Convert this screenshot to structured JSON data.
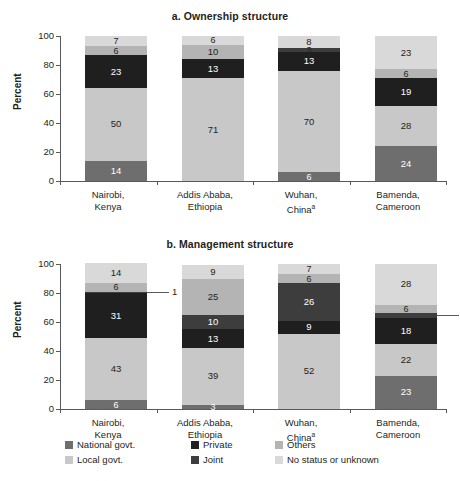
{
  "figure": {
    "ylabel": "Percent",
    "yticks": [
      "0",
      "20",
      "40",
      "60",
      "80",
      "100"
    ],
    "categories": [
      "Nairobi,\nKenya",
      "Addis Ababa,\nEthiopia",
      "Wuhan,\nChina",
      "Bamenda,\nCameroon"
    ],
    "category_lines": [
      {
        "l1": "Nairobi,",
        "l2": "Kenya",
        "sup": ""
      },
      {
        "l1": "Addis Ababa,",
        "l2": "Ethiopia",
        "sup": ""
      },
      {
        "l1": "Wuhan,",
        "l2": "China",
        "sup": "a"
      },
      {
        "l1": "Bamenda,",
        "l2": "Cameroon",
        "sup": ""
      }
    ]
  },
  "legend": {
    "position": "bottom",
    "items": [
      {
        "label": "National govt.",
        "color": "#6e6e6e"
      },
      {
        "label": "Private",
        "color": "#1f1f1f"
      },
      {
        "label": "Others",
        "color": "#b4b4b4"
      },
      {
        "label": "Local govt.",
        "color": "#c8c8c8"
      },
      {
        "label": "Joint",
        "color": "#3d3d3d"
      },
      {
        "label": "No status or unknown",
        "color": "#d9d9d9"
      }
    ]
  },
  "chart_data": [
    {
      "type": "bar",
      "subtype": "stacked-vertical-100",
      "title": "a. Ownership structure",
      "xlabel": "",
      "ylabel": "Percent",
      "ylim": [
        0,
        100
      ],
      "yticks": [
        0,
        20,
        40,
        60,
        80,
        100
      ],
      "grid": false,
      "legend": "bottom",
      "categories": [
        "Nairobi, Kenya",
        "Addis Ababa, Ethiopia",
        "Wuhan, China",
        "Bamenda, Cameroon"
      ],
      "series": [
        {
          "name": "National govt.",
          "color": "#6e6e6e",
          "values": [
            14,
            0,
            6,
            24
          ]
        },
        {
          "name": "Local govt.",
          "color": "#c8c8c8",
          "values": [
            50,
            71,
            70,
            28
          ]
        },
        {
          "name": "Private",
          "color": "#1f1f1f",
          "values": [
            23,
            13,
            13,
            19
          ]
        },
        {
          "name": "Joint",
          "color": "#3d3d3d",
          "values": [
            0,
            0,
            3,
            0
          ]
        },
        {
          "name": "Others",
          "color": "#b4b4b4",
          "values": [
            6,
            10,
            0,
            6
          ]
        },
        {
          "name": "No status or unknown",
          "color": "#d9d9d9",
          "values": [
            7,
            6,
            8,
            23
          ]
        }
      ],
      "bars": [
        {
          "category": "Nairobi, Kenya",
          "segments": [
            {
              "series": "National govt.",
              "value": 14,
              "label": "14",
              "color": "#6e6e6e",
              "text": "light-on-dark"
            },
            {
              "series": "Local govt.",
              "value": 50,
              "label": "50",
              "color": "#c8c8c8",
              "text": "dark-on-light"
            },
            {
              "series": "Private",
              "value": 23,
              "label": "23",
              "color": "#1f1f1f",
              "text": "light-on-dark"
            },
            {
              "series": "Others",
              "value": 6,
              "label": "6",
              "color": "#b4b4b4",
              "text": "dark-on-light"
            },
            {
              "series": "No status or unknown",
              "value": 7,
              "label": "7",
              "color": "#d9d9d9",
              "text": "dark-on-light"
            }
          ]
        },
        {
          "category": "Addis Ababa, Ethiopia",
          "segments": [
            {
              "series": "Local govt.",
              "value": 71,
              "label": "71",
              "color": "#c8c8c8",
              "text": "dark-on-light"
            },
            {
              "series": "Private",
              "value": 13,
              "label": "13",
              "color": "#1f1f1f",
              "text": "light-on-dark"
            },
            {
              "series": "Others",
              "value": 10,
              "label": "10",
              "color": "#b4b4b4",
              "text": "dark-on-light"
            },
            {
              "series": "No status or unknown",
              "value": 6,
              "label": "6",
              "color": "#d9d9d9",
              "text": "dark-on-light"
            }
          ]
        },
        {
          "category": "Wuhan, China",
          "segments": [
            {
              "series": "National govt.",
              "value": 6,
              "label": "6",
              "color": "#6e6e6e",
              "text": "light-on-dark"
            },
            {
              "series": "Local govt.",
              "value": 70,
              "label": "70",
              "color": "#c8c8c8",
              "text": "dark-on-light"
            },
            {
              "series": "Private",
              "value": 13,
              "label": "13",
              "color": "#1f1f1f",
              "text": "light-on-dark"
            },
            {
              "series": "Joint",
              "value": 3,
              "label": "3",
              "color": "#3d3d3d",
              "text": "dark-on-light"
            },
            {
              "series": "No status or unknown",
              "value": 8,
              "label": "8",
              "color": "#d9d9d9",
              "text": "dark-on-light"
            }
          ]
        },
        {
          "category": "Bamenda, Cameroon",
          "segments": [
            {
              "series": "National govt.",
              "value": 24,
              "label": "24",
              "color": "#6e6e6e",
              "text": "light-on-dark"
            },
            {
              "series": "Local govt.",
              "value": 28,
              "label": "28",
              "color": "#c8c8c8",
              "text": "dark-on-light"
            },
            {
              "series": "Private",
              "value": 19,
              "label": "19",
              "color": "#1f1f1f",
              "text": "light-on-dark"
            },
            {
              "series": "Others",
              "value": 6,
              "label": "6",
              "color": "#b4b4b4",
              "text": "dark-on-light"
            },
            {
              "series": "No status or unknown",
              "value": 23,
              "label": "23",
              "color": "#d9d9d9",
              "text": "dark-on-light"
            }
          ]
        }
      ]
    },
    {
      "type": "bar",
      "subtype": "stacked-vertical-100",
      "title": "b. Management structure",
      "xlabel": "",
      "ylabel": "Percent",
      "ylim": [
        0,
        100
      ],
      "yticks": [
        0,
        20,
        40,
        60,
        80,
        100
      ],
      "grid": false,
      "legend": "bottom",
      "categories": [
        "Nairobi, Kenya",
        "Addis Ababa, Ethiopia",
        "Wuhan, China",
        "Bamenda, Cameroon"
      ],
      "annotations": [
        {
          "category": "Nairobi, Kenya",
          "series": "Joint",
          "value": 1,
          "label": "1",
          "style": "leader-line-right"
        },
        {
          "category": "Bamenda, Cameroon",
          "series": "Joint",
          "value": 3,
          "label": "3",
          "style": "leader-line-right"
        }
      ],
      "series": [
        {
          "name": "National govt.",
          "color": "#6e6e6e",
          "values": [
            6,
            3,
            0,
            23
          ]
        },
        {
          "name": "Local govt.",
          "color": "#c8c8c8",
          "values": [
            43,
            39,
            52,
            22
          ]
        },
        {
          "name": "Private",
          "color": "#1f1f1f",
          "values": [
            31,
            13,
            9,
            18
          ]
        },
        {
          "name": "Joint",
          "color": "#3d3d3d",
          "values": [
            1,
            10,
            26,
            3
          ]
        },
        {
          "name": "Others",
          "color": "#b4b4b4",
          "values": [
            6,
            25,
            6,
            6
          ]
        },
        {
          "name": "No status or unknown",
          "color": "#d9d9d9",
          "values": [
            14,
            9,
            7,
            28
          ]
        }
      ],
      "bars": [
        {
          "category": "Nairobi, Kenya",
          "segments": [
            {
              "series": "National govt.",
              "value": 6,
              "label": "6",
              "color": "#6e6e6e",
              "text": "light-on-dark"
            },
            {
              "series": "Local govt.",
              "value": 43,
              "label": "43",
              "color": "#c8c8c8",
              "text": "dark-on-light"
            },
            {
              "series": "Private",
              "value": 31,
              "label": "31",
              "color": "#1f1f1f",
              "text": "light-on-dark"
            },
            {
              "series": "Joint",
              "value": 1,
              "label": "1",
              "color": "#3d3d3d",
              "text": "callout"
            },
            {
              "series": "Others",
              "value": 6,
              "label": "6",
              "color": "#b4b4b4",
              "text": "dark-on-light"
            },
            {
              "series": "No status or unknown",
              "value": 14,
              "label": "14",
              "color": "#d9d9d9",
              "text": "dark-on-light"
            }
          ]
        },
        {
          "category": "Addis Ababa, Ethiopia",
          "segments": [
            {
              "series": "National govt.",
              "value": 3,
              "label": "3",
              "color": "#6e6e6e",
              "text": "light-on-dark"
            },
            {
              "series": "Local govt.",
              "value": 39,
              "label": "39",
              "color": "#c8c8c8",
              "text": "dark-on-light"
            },
            {
              "series": "Private",
              "value": 13,
              "label": "13",
              "color": "#1f1f1f",
              "text": "light-on-dark"
            },
            {
              "series": "Joint",
              "value": 10,
              "label": "10",
              "color": "#3d3d3d",
              "text": "light-on-dark"
            },
            {
              "series": "Others",
              "value": 25,
              "label": "25",
              "color": "#b4b4b4",
              "text": "dark-on-light"
            },
            {
              "series": "No status or unknown",
              "value": 9,
              "label": "9",
              "color": "#d9d9d9",
              "text": "dark-on-light"
            }
          ]
        },
        {
          "category": "Wuhan, China",
          "segments": [
            {
              "series": "Local govt.",
              "value": 52,
              "label": "52",
              "color": "#c8c8c8",
              "text": "dark-on-light"
            },
            {
              "series": "Private",
              "value": 9,
              "label": "9",
              "color": "#1f1f1f",
              "text": "light-on-dark"
            },
            {
              "series": "Joint",
              "value": 26,
              "label": "26",
              "color": "#3d3d3d",
              "text": "light-on-dark"
            },
            {
              "series": "Others",
              "value": 6,
              "label": "6",
              "color": "#b4b4b4",
              "text": "dark-on-light"
            },
            {
              "series": "No status or unknown",
              "value": 7,
              "label": "7",
              "color": "#d9d9d9",
              "text": "dark-on-light"
            }
          ]
        },
        {
          "category": "Bamenda, Cameroon",
          "segments": [
            {
              "series": "National govt.",
              "value": 23,
              "label": "23",
              "color": "#6e6e6e",
              "text": "light-on-dark"
            },
            {
              "series": "Local govt.",
              "value": 22,
              "label": "22",
              "color": "#c8c8c8",
              "text": "dark-on-light"
            },
            {
              "series": "Private",
              "value": 18,
              "label": "18",
              "color": "#1f1f1f",
              "text": "light-on-dark"
            },
            {
              "series": "Joint",
              "value": 3,
              "label": "3",
              "color": "#3d3d3d",
              "text": "callout"
            },
            {
              "series": "Others",
              "value": 6,
              "label": "6",
              "color": "#b4b4b4",
              "text": "dark-on-light"
            },
            {
              "series": "No status or unknown",
              "value": 28,
              "label": "28",
              "color": "#d9d9d9",
              "text": "dark-on-light"
            }
          ]
        }
      ]
    }
  ]
}
